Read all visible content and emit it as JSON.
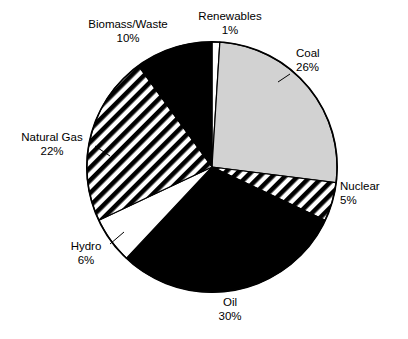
{
  "chart_data": {
    "type": "pie",
    "title": "",
    "title_note": "cropped-illegible-title-strip-at-top",
    "xlabel": "",
    "ylabel": "",
    "legend": "none",
    "grid": false,
    "units": "percent",
    "total": 100,
    "start_angle_deg": 0,
    "direction": "clockwise",
    "categories": [
      "Renewables",
      "Coal",
      "Nuclear",
      "Oil",
      "Hydro",
      "Natural Gas",
      "Biomass/Waste"
    ],
    "values": [
      1,
      26,
      5,
      30,
      6,
      22,
      10
    ],
    "slices": [
      {
        "label": "Renewables",
        "value": 1,
        "value_text": "1%",
        "fill": "white",
        "color": "#ffffff",
        "start_deg": 0.0,
        "end_deg": 3.6,
        "label_position": "top",
        "leader": false
      },
      {
        "label": "Coal",
        "value": 26,
        "value_text": "26%",
        "fill": "solid-gray",
        "color": "#d2d2d2",
        "start_deg": 3.6,
        "end_deg": 97.2,
        "label_position": "right-upper",
        "leader": true
      },
      {
        "label": "Nuclear",
        "value": 5,
        "value_text": "5%",
        "fill": "diagonal-hatch",
        "color": "#000000",
        "start_deg": 97.2,
        "end_deg": 115.2,
        "label_position": "right-lower",
        "leader": false
      },
      {
        "label": "Oil",
        "value": 30,
        "value_text": "30%",
        "fill": "solid-black",
        "color": "#000000",
        "start_deg": 115.2,
        "end_deg": 223.2,
        "label_position": "bottom",
        "leader": false
      },
      {
        "label": "Hydro",
        "value": 6,
        "value_text": "6%",
        "fill": "white",
        "color": "#ffffff",
        "start_deg": 223.2,
        "end_deg": 244.8,
        "label_position": "bottom-left",
        "leader": true
      },
      {
        "label": "Natural Gas",
        "value": 22,
        "value_text": "22%",
        "fill": "diagonal-hatch",
        "color": "#000000",
        "start_deg": 244.8,
        "end_deg": 324.0,
        "label_position": "left",
        "leader": true
      },
      {
        "label": "Biomass/Waste",
        "value": 10,
        "value_text": "10%",
        "fill": "solid-black",
        "color": "#000000",
        "start_deg": 324.0,
        "end_deg": 360.0,
        "label_position": "top-left",
        "leader": false
      }
    ]
  },
  "labels": {
    "renewables": {
      "name": "Renewables",
      "pct": "1%"
    },
    "coal": {
      "name": "Coal",
      "pct": "26%"
    },
    "nuclear": {
      "name": "Nuclear",
      "pct": "5%"
    },
    "oil": {
      "name": "Oil",
      "pct": "30%"
    },
    "hydro": {
      "name": "Hydro",
      "pct": "6%"
    },
    "natural_gas": {
      "name": "Natural Gas",
      "pct": "22%"
    },
    "biomass_waste": {
      "name": "Biomass/Waste",
      "pct": "10%"
    }
  },
  "style": {
    "background": "#ffffff",
    "outline": "#000000",
    "coal_gray": "#d2d2d2",
    "black": "#000000",
    "white": "#ffffff"
  }
}
